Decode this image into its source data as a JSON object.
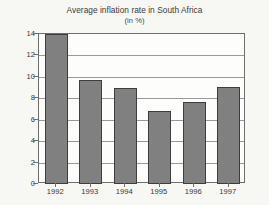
{
  "chart_data": {
    "type": "bar",
    "title": "Average inflation rate in South Africa",
    "subtitle": "(in %)",
    "xlabel": "",
    "ylabel": "",
    "categories": [
      "1992",
      "1993",
      "1994",
      "1995",
      "1996",
      "1997"
    ],
    "values": [
      14.0,
      9.7,
      9.0,
      6.8,
      7.7,
      9.1
    ],
    "ylim": [
      0,
      14
    ],
    "ytick_values": [
      0,
      2,
      4,
      6,
      8,
      10,
      12,
      14
    ],
    "ytick_labels": [
      "0",
      "2",
      "4",
      "6",
      "8",
      "10",
      "12",
      "14"
    ],
    "grid": true,
    "grid_axis": "y",
    "legend": false,
    "legend_position": "none",
    "bar_color": "#808080",
    "bar_edge_color": "#3d3d3d",
    "plot_background": "#fdfdfb",
    "page_background": "#f7f7f4",
    "axis_color": "#6e6e6e",
    "gridline_color": "#9a9a9a",
    "text_color": "#3a3a3a"
  }
}
